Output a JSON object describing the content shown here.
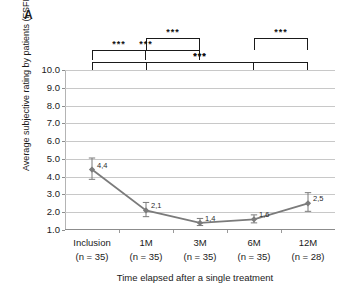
{
  "panel": {
    "label": "A"
  },
  "chart_data": {
    "type": "line",
    "title": "",
    "subtitle": "",
    "xlabel": "Time elapsed after a single treatment",
    "ylabel": "Average subjective rating by patients (FSFI)",
    "categories": [
      "Inclusion",
      "1M",
      "3M",
      "6M",
      "12M"
    ],
    "category_sublabels": [
      "(n = 35)",
      "(n = 35)",
      "(n = 35)",
      "(n = 35)",
      "(n = 28)"
    ],
    "values": [
      4.4,
      2.1,
      1.4,
      1.6,
      2.5
    ],
    "point_labels": [
      "4,4",
      "2,1",
      "1,4",
      "1,6",
      "2,5"
    ],
    "error_upper": [
      5.05,
      2.55,
      1.65,
      1.85,
      3.1
    ],
    "error_lower": [
      3.85,
      1.75,
      1.25,
      1.4,
      2.05
    ],
    "ylim": [
      1.0,
      10.0
    ],
    "ytick_labels": [
      "10.0",
      "9.0",
      "8.0",
      "7.0",
      "6.0",
      "5.0",
      "4.0",
      "3.0",
      "2.0",
      "1.0"
    ],
    "ytick_values": [
      10.0,
      9.0,
      8.0,
      7.0,
      6.0,
      5.0,
      4.0,
      3.0,
      2.0,
      1.0
    ],
    "grid": true,
    "legend": "none",
    "series_color": "#7b7b7b",
    "grid_color": "#c8c8c8",
    "marker": "diamond",
    "annotations": [
      {
        "stars": "***",
        "from": "Inclusion",
        "to": "1M",
        "level": 1
      },
      {
        "stars": "***",
        "from": "1M",
        "to": "3M",
        "level": 2
      },
      {
        "stars": "***",
        "from": "Inclusion",
        "to": "3M",
        "level": 1
      },
      {
        "stars": "***",
        "from": "1M",
        "to": "6M",
        "level": 0
      },
      {
        "stars": "***",
        "from": "6M",
        "to": "12M",
        "level": 2
      },
      {
        "stars": "***",
        "from": "Inclusion",
        "to": "12M",
        "level": 0
      }
    ]
  }
}
